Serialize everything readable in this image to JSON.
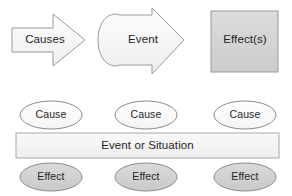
{
  "diagram": {
    "background_color": "#ffffff",
    "top_row": {
      "causes_arrow": {
        "label": "Causes",
        "shape": "right-block-arrow",
        "fill": "#f2f2f2",
        "stroke": "#9a9a9a"
      },
      "event_arrow": {
        "label": "Event",
        "shape": "rounded-left-block-arrow",
        "fill": "#f2f2f2",
        "stroke": "#9a9a9a"
      },
      "effects_box": {
        "label": "Effect(s)",
        "shape": "rectangle",
        "fill": "#d4d4d4",
        "stroke": "#9a9a9a"
      }
    },
    "bottom_row": {
      "causes": [
        {
          "label": "Cause",
          "shape": "ellipse",
          "fill": "#fbfbfb",
          "stroke": "#8c8c8c"
        },
        {
          "label": "Cause",
          "shape": "ellipse",
          "fill": "#fbfbfb",
          "stroke": "#8c8c8c"
        },
        {
          "label": "Cause",
          "shape": "ellipse",
          "fill": "#fbfbfb",
          "stroke": "#8c8c8c"
        }
      ],
      "event_bar": {
        "label": "Event or Situation",
        "shape": "rectangle",
        "fill": "#f4f4f4",
        "stroke": "#a8a8a8"
      },
      "effects": [
        {
          "label": "Effect",
          "shape": "ellipse",
          "fill": "#d2d2d2",
          "stroke": "#8c8c8c"
        },
        {
          "label": "Effect",
          "shape": "ellipse",
          "fill": "#d2d2d2",
          "stroke": "#8c8c8c"
        },
        {
          "label": "Effect",
          "shape": "ellipse",
          "fill": "#d2d2d2",
          "stroke": "#8c8c8c"
        }
      ]
    }
  }
}
